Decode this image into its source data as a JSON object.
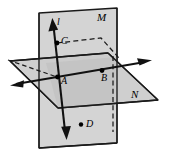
{
  "figure": {
    "background_color": "#ffffff",
    "plane_fill": "#d2d2d2",
    "plane_fill_dark": "#c0c0c0",
    "stroke_color": "#1a1a1a",
    "point_color": "#000000"
  },
  "labels": {
    "plane_vertical": "M",
    "plane_horizontal": "N",
    "line": "l",
    "point_a": "A",
    "point_b": "B",
    "point_c": "C",
    "point_d": "D"
  },
  "geometry": {
    "plane_M_polygon": "39,13 117,8 117,143 39,148",
    "plane_N_polygon": "10,61 108,53 158,100 58,108",
    "line_l": {
      "x1": 52,
      "y1": 20,
      "x2": 66,
      "y2": 137
    },
    "axis_horizontal": {
      "x1": 12,
      "y1": 85,
      "x2": 148,
      "y2": 61
    },
    "points": {
      "A": {
        "x": 57,
        "y": 77
      },
      "B": {
        "x": 102,
        "y": 73
      },
      "C": {
        "x": 57,
        "y": 43
      },
      "D": {
        "x": 81,
        "y": 125
      }
    },
    "dashed_segments": [
      "57,43 100,38 117,57",
      "113,57 113,130"
    ]
  }
}
